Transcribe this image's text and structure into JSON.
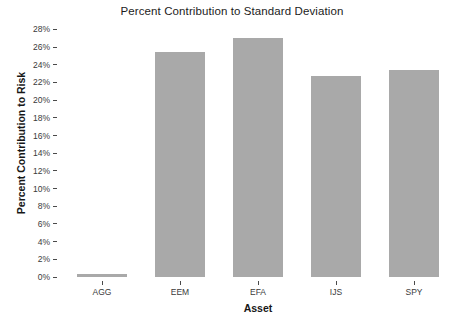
{
  "chart_data": {
    "type": "bar",
    "title": "Percent Contribution to Standard Deviation",
    "xlabel": "Asset",
    "ylabel": "Percent Contribution to Risk",
    "categories": [
      "AGG",
      "EEM",
      "EFA",
      "IJS",
      "SPY"
    ],
    "values": [
      0.3,
      25.5,
      27.0,
      22.7,
      23.4
    ],
    "value_labels": [
      "0.3%",
      "25.5%",
      "27.0%",
      "22.7%",
      "23.4%"
    ],
    "ylim": [
      0,
      28.5
    ],
    "ytick_values": [
      0,
      2,
      4,
      6,
      8,
      10,
      12,
      14,
      16,
      18,
      20,
      22,
      24,
      26,
      28
    ],
    "ytick_labels": [
      "0%",
      "2%",
      "4%",
      "6%",
      "8%",
      "10%",
      "12%",
      "14%",
      "16%",
      "18%",
      "20%",
      "22%",
      "24%",
      "26%",
      "28%"
    ],
    "grid": false,
    "legend": "none",
    "bar_color": "#a9a9a9",
    "background_color": "#ffffff",
    "axis_text_color": "#3a3a3a"
  }
}
